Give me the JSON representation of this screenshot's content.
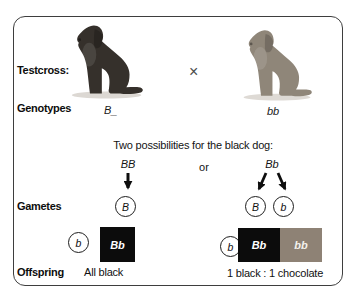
{
  "panel": {
    "border_color": "#3e3e3e",
    "background": "#ffffff"
  },
  "row_labels": {
    "testcross": "Testcross:",
    "genotypes": "Genotypes",
    "gametes": "Gametes",
    "offspring": "Offspring"
  },
  "cross": {
    "symbol": "×",
    "left_parent": {
      "illustration": "black-labrador-sitting",
      "color": "#35302b",
      "genotype": "B_"
    },
    "right_parent": {
      "illustration": "chocolate-labrador-sitting",
      "color": "#8f8679",
      "genotype": "bb"
    }
  },
  "possibilities": {
    "heading": "Two possibilities for the black dog:",
    "or": "or",
    "case1": {
      "parent_genotype": "BB",
      "gametes": [
        "B"
      ]
    },
    "case2": {
      "parent_genotype": "Bb",
      "gametes": [
        "B",
        "b"
      ]
    }
  },
  "punnett": {
    "case1": {
      "tester_gamete": "b",
      "cells": [
        {
          "genotype": "Bb",
          "bg": "#0c0c0c",
          "fg": "#ffffff"
        }
      ],
      "caption": "All black"
    },
    "case2": {
      "tester_gamete": "b",
      "cells": [
        {
          "genotype": "Bb",
          "bg": "#0c0c0c",
          "fg": "#ffffff"
        },
        {
          "genotype": "bb",
          "bg": "#8e8275",
          "fg": "#f3f1ec"
        }
      ],
      "caption": "1 black : 1 chocolate"
    }
  }
}
